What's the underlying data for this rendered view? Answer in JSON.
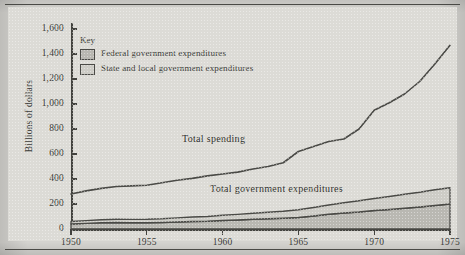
{
  "figure": {
    "y_axis_title": "Billions of dollars"
  },
  "legend": {
    "title": "Key",
    "items": [
      {
        "label": "Federal government expenditures",
        "color": "#b9b8b2"
      },
      {
        "label": "State and local government expenditures",
        "color": "#cdccc6"
      }
    ]
  },
  "annotations": [
    {
      "name": "total-spending",
      "text": "Total spending"
    },
    {
      "name": "total-government-expenditures",
      "text": "Total government expenditures"
    }
  ],
  "chart_data": {
    "type": "area",
    "title": "",
    "subtitle": "",
    "xlabel": "",
    "ylabel": "Billions of dollars",
    "xlim": [
      1950,
      1975
    ],
    "ylim": [
      0,
      1600
    ],
    "grid": false,
    "legend_position": "inside-top-left",
    "x_ticks": [
      "1950",
      "1955",
      "1960",
      "1965",
      "1970",
      "1975"
    ],
    "x_tick_values": [
      1950,
      1955,
      1960,
      1965,
      1970,
      1975
    ],
    "y_ticks": [
      "0",
      "200",
      "400",
      "600",
      "800",
      "1,000",
      "1,200",
      "1,400",
      "1,600"
    ],
    "y_tick_values": [
      0,
      200,
      400,
      600,
      800,
      1000,
      1200,
      1400,
      1600
    ],
    "x": [
      1950,
      1951,
      1952,
      1953,
      1954,
      1955,
      1956,
      1957,
      1958,
      1959,
      1960,
      1961,
      1962,
      1963,
      1964,
      1965,
      1966,
      1967,
      1968,
      1969,
      1970,
      1971,
      1972,
      1973,
      1974,
      1975
    ],
    "series": [
      {
        "name": "Federal government expenditures",
        "stacked": true,
        "color": "#b9b8b2",
        "values": [
          40,
          45,
          50,
          52,
          50,
          50,
          52,
          56,
          60,
          62,
          68,
          72,
          78,
          82,
          86,
          92,
          104,
          118,
          128,
          136,
          148,
          156,
          166,
          176,
          188,
          200
        ]
      },
      {
        "name": "State and local government expenditures",
        "stacked": true,
        "color": "#cdccc6",
        "values": [
          20,
          22,
          24,
          26,
          27,
          28,
          30,
          33,
          36,
          38,
          42,
          45,
          48,
          52,
          56,
          62,
          68,
          74,
          82,
          90,
          96,
          104,
          112,
          118,
          126,
          130
        ]
      }
    ],
    "stacked_total": {
      "name": "Total government expenditures",
      "values": [
        60,
        67,
        74,
        78,
        77,
        78,
        82,
        89,
        96,
        100,
        110,
        117,
        126,
        134,
        142,
        154,
        172,
        192,
        210,
        226,
        244,
        260,
        278,
        294,
        314,
        330
      ]
    },
    "lines": [
      {
        "name": "Total spending",
        "color": "#4a4a46",
        "values": [
          280,
          305,
          325,
          340,
          345,
          350,
          370,
          390,
          405,
          425,
          440,
          455,
          480,
          500,
          530,
          620,
          660,
          700,
          720,
          800,
          950,
          1010,
          1080,
          1180,
          1320,
          1470
        ]
      }
    ]
  }
}
